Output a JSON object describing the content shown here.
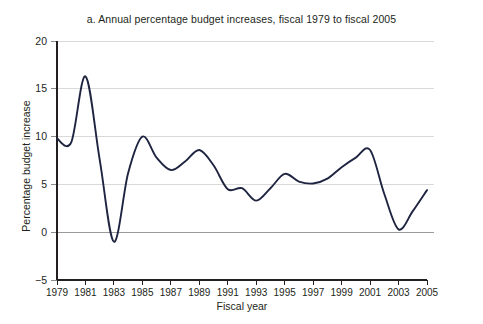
{
  "figure": {
    "title": "a. Annual percentage budget increases, fiscal 1979 to fiscal 2005",
    "y_axis_title": "Percentage budget increase",
    "x_axis_title": "Fiscal year",
    "line_color": "#1f2440",
    "grid_color": "#d9d9d9",
    "text_color": "#231f20"
  },
  "chart_data": {
    "type": "line",
    "title": "a. Annual percentage budget increases, fiscal 1979 to fiscal 2005",
    "xlabel": "Fiscal year",
    "ylabel": "Percentage budget increase",
    "xlim": [
      1979,
      2005
    ],
    "ylim": [
      -5,
      20
    ],
    "yticks": [
      -5,
      0,
      5,
      10,
      15,
      20
    ],
    "ytick_labels": [
      "−5",
      "0",
      "5",
      "10",
      "15",
      "20"
    ],
    "xticks": [
      1979,
      1981,
      1983,
      1985,
      1987,
      1989,
      1991,
      1993,
      1995,
      1997,
      1999,
      2001,
      2003,
      2005
    ],
    "xtick_labels": [
      "1979",
      "1981",
      "1983",
      "1985",
      "1987",
      "1989",
      "1991",
      "1993",
      "1995",
      "1997",
      "1999",
      "2001",
      "2003",
      "2005"
    ],
    "grid": true,
    "legend": "none",
    "x": [
      1979,
      1980,
      1981,
      1982,
      1983,
      1984,
      1985,
      1986,
      1987,
      1988,
      1989,
      1990,
      1991,
      1992,
      1993,
      1994,
      1995,
      1996,
      1997,
      1998,
      1999,
      2000,
      2001,
      2002,
      2003,
      2004,
      2005
    ],
    "series": [
      {
        "name": "Annual percentage budget increase",
        "values": [
          9.8,
          9.4,
          16.3,
          7.6,
          -1.0,
          6.2,
          10.0,
          7.8,
          6.5,
          7.4,
          8.6,
          7.0,
          4.5,
          4.6,
          3.3,
          4.6,
          6.1,
          5.3,
          5.1,
          5.6,
          6.8,
          7.8,
          8.6,
          4.0,
          0.3,
          2.2,
          4.4
        ]
      }
    ]
  }
}
